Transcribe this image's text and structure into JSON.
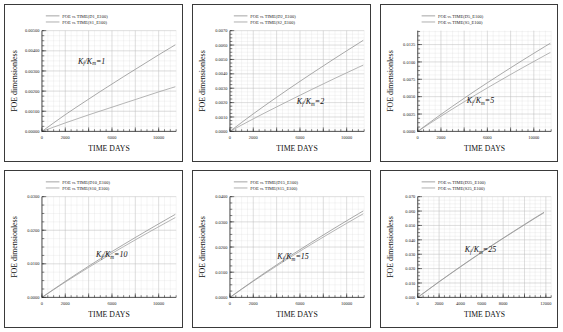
{
  "figure": {
    "panel_count": 6,
    "axis_titles": {
      "x": "TIME DAYS",
      "y": "FOE dimensionless"
    },
    "legend_prefix": "FOE",
    "legend_vs": "vs.",
    "colors": {
      "curve_d": "#8a8a8a",
      "curve_s": "#9a9a9a",
      "grid": "#d6d6d6",
      "axis": "#2b2b2b",
      "border": "#3a3a3a"
    }
  },
  "chart_data": [
    {
      "type": "line",
      "id": "panel-1",
      "title": "",
      "xlabel": "TIME DAYS",
      "ylabel": "FOE dimensionless",
      "annotation": "K_f/K_m=1",
      "annotation_main": "K",
      "annotation_sub1": "f",
      "annotation_mid": "/K",
      "annotation_sub2": "m",
      "annotation_end": "=1",
      "xlim": [
        0,
        11500
      ],
      "ylim": [
        0,
        0.005
      ],
      "xticks": [
        0,
        2000,
        4000,
        6000,
        8000,
        10000
      ],
      "xticklabels": [
        "0",
        "2000",
        "",
        "6000",
        "",
        "10000"
      ],
      "yticks": [
        0,
        0.001,
        0.002,
        0.003,
        0.004,
        0.005
      ],
      "yticklabels": [
        "0.00000",
        "0.00100",
        "0.00200",
        "0.00300",
        "0.00400",
        "0.00500"
      ],
      "grid": true,
      "legend_position": "top-left",
      "series": [
        {
          "name": "FOE vs. TIME(D1_E100)",
          "x": [
            0,
            1000,
            2000,
            3000,
            4000,
            5000,
            6000,
            7000,
            8000,
            9000,
            10000,
            11000,
            11400
          ],
          "values": [
            0.0,
            0.00042,
            0.00083,
            0.00122,
            0.0016,
            0.00198,
            0.00235,
            0.00272,
            0.00308,
            0.00344,
            0.0038,
            0.00415,
            0.00429
          ]
        },
        {
          "name": "FOE vs. TIME(S1_E100)",
          "x": [
            0,
            1000,
            2000,
            3000,
            4000,
            5000,
            6000,
            7000,
            8000,
            9000,
            10000,
            11000,
            11400
          ],
          "values": [
            0.0,
            0.00021,
            0.00042,
            0.00062,
            0.00082,
            0.00101,
            0.0012,
            0.00139,
            0.00158,
            0.00177,
            0.00196,
            0.00214,
            0.00221
          ]
        }
      ]
    },
    {
      "type": "line",
      "id": "panel-2",
      "title": "",
      "xlabel": "TIME DAYS",
      "ylabel": "FOE dimensionless",
      "annotation": "K_f/K_m=2",
      "annotation_main": "K",
      "annotation_sub1": "f",
      "annotation_mid": "/K",
      "annotation_sub2": "m",
      "annotation_end": "=2",
      "xlim": [
        0,
        11500
      ],
      "ylim": [
        0,
        0.007
      ],
      "xticks": [
        0,
        2000,
        4000,
        6000,
        8000,
        10000
      ],
      "xticklabels": [
        "0",
        "2000",
        "",
        "6000",
        "",
        "10000"
      ],
      "yticks": [
        0,
        0.001,
        0.002,
        0.003,
        0.004,
        0.005,
        0.006,
        0.007
      ],
      "yticklabels": [
        "0.0000",
        "0.0010",
        "0.0020",
        "0.0030",
        "0.0040",
        "0.0050",
        "0.0060",
        "0.0070"
      ],
      "grid": true,
      "legend_position": "top-left",
      "series": [
        {
          "name": "FOE vs. TIME(D2_E100)",
          "x": [
            0,
            1000,
            2000,
            3000,
            4000,
            5000,
            6000,
            7000,
            8000,
            9000,
            10000,
            11000,
            11400
          ],
          "values": [
            0.0,
            0.00062,
            0.00122,
            0.0018,
            0.00237,
            0.00293,
            0.00348,
            0.00402,
            0.00455,
            0.00508,
            0.0056,
            0.00611,
            0.00632
          ]
        },
        {
          "name": "FOE vs. TIME(S2_E100)",
          "x": [
            0,
            1000,
            2000,
            3000,
            4000,
            5000,
            6000,
            7000,
            8000,
            9000,
            10000,
            11000,
            11400
          ],
          "values": [
            0.0,
            0.00044,
            0.00087,
            0.00129,
            0.0017,
            0.00211,
            0.00251,
            0.00291,
            0.0033,
            0.00369,
            0.00407,
            0.00445,
            0.0046
          ]
        }
      ]
    },
    {
      "type": "line",
      "id": "panel-3",
      "title": "",
      "xlabel": "TIME DAYS",
      "ylabel": "FOE dimensionless",
      "annotation": "K_f/K_m=5",
      "annotation_main": "K",
      "annotation_sub1": "f",
      "annotation_mid": "/K",
      "annotation_sub2": "m",
      "annotation_end": "=5",
      "xlim": [
        0,
        11500
      ],
      "ylim": [
        0,
        0.0145
      ],
      "xticks": [
        0,
        2000,
        4000,
        6000,
        8000,
        10000
      ],
      "xticklabels": [
        "0",
        "2000",
        "",
        "6000",
        "",
        "10000"
      ],
      "yticks": [
        0,
        0.0025,
        0.005,
        0.0075,
        0.01,
        0.0125
      ],
      "yticklabels": [
        "0.0000",
        "0.0025",
        "0.0050",
        "0.0075",
        "0.0100",
        "0.0125"
      ],
      "grid": true,
      "legend_position": "top-left",
      "series": [
        {
          "name": "FOE vs. TIME(D5_E100)",
          "x": [
            0,
            1000,
            2000,
            3000,
            4000,
            5000,
            6000,
            7000,
            8000,
            9000,
            10000,
            11000,
            11400
          ],
          "values": [
            0.0,
            0.00124,
            0.00245,
            0.00362,
            0.00477,
            0.0059,
            0.007,
            0.00808,
            0.00915,
            0.0102,
            0.01124,
            0.01226,
            0.01266
          ]
        },
        {
          "name": "FOE vs. TIME(S5_E100)",
          "x": [
            0,
            1000,
            2000,
            3000,
            4000,
            5000,
            6000,
            7000,
            8000,
            9000,
            10000,
            11000,
            11400
          ],
          "values": [
            0.0,
            0.0011,
            0.00218,
            0.00323,
            0.00426,
            0.00527,
            0.00626,
            0.00723,
            0.00819,
            0.00913,
            0.01006,
            0.01098,
            0.01134
          ]
        }
      ]
    },
    {
      "type": "line",
      "id": "panel-4",
      "title": "",
      "xlabel": "TIME DAYS",
      "ylabel": "FOE dimensionless",
      "annotation": "K_f/K_m=10",
      "annotation_main": "K",
      "annotation_sub1": "f",
      "annotation_mid": "/K",
      "annotation_sub2": "m",
      "annotation_end": "=10",
      "xlim": [
        0,
        11500
      ],
      "ylim": [
        0,
        0.03
      ],
      "xticks": [
        0,
        2000,
        4000,
        6000,
        8000,
        10000
      ],
      "xticklabels": [
        "0",
        "2000",
        "",
        "6000",
        "",
        "10000"
      ],
      "yticks": [
        0,
        0.01,
        0.02,
        0.03
      ],
      "yticklabels": [
        "0.0000",
        "0.0100",
        "0.0200",
        "0.0300"
      ],
      "grid": true,
      "legend_position": "top-left",
      "series": [
        {
          "name": "FOE vs. TIME(D10_E100)",
          "x": [
            0,
            1000,
            2000,
            3000,
            4000,
            5000,
            6000,
            7000,
            8000,
            9000,
            10000,
            11000,
            11400
          ],
          "values": [
            0.0,
            0.0024,
            0.00476,
            0.00705,
            0.0093,
            0.0115,
            0.01365,
            0.01576,
            0.01783,
            0.01988,
            0.0219,
            0.02389,
            0.02468
          ]
        },
        {
          "name": "FOE vs. TIME(S10_E100)",
          "x": [
            0,
            1000,
            2000,
            3000,
            4000,
            5000,
            6000,
            7000,
            8000,
            9000,
            10000,
            11000,
            11400
          ],
          "values": [
            0.0,
            0.0023,
            0.00456,
            0.00676,
            0.00892,
            0.01103,
            0.0131,
            0.01513,
            0.01713,
            0.0191,
            0.02104,
            0.02296,
            0.02372
          ]
        }
      ]
    },
    {
      "type": "line",
      "id": "panel-5",
      "title": "",
      "xlabel": "TIME DAYS",
      "ylabel": "FOE dimensionless",
      "annotation": "K_f/K_m=15",
      "annotation_main": "K",
      "annotation_sub1": "f",
      "annotation_mid": "/K",
      "annotation_sub2": "m",
      "annotation_end": "=15",
      "xlim": [
        0,
        11500
      ],
      "ylim": [
        0,
        0.04
      ],
      "xticks": [
        0,
        2000,
        4000,
        6000,
        8000,
        10000
      ],
      "xticklabels": [
        "0",
        "2000",
        "",
        "6000",
        "",
        "10000"
      ],
      "yticks": [
        0,
        0.01,
        0.02,
        0.03,
        0.04
      ],
      "yticklabels": [
        "0.0000",
        "0.0100",
        "0.0200",
        "0.0300",
        "0.0400"
      ],
      "grid": true,
      "legend_position": "top-left",
      "series": [
        {
          "name": "FOE vs. TIME(D15_E100)",
          "x": [
            0,
            1000,
            2000,
            3000,
            4000,
            5000,
            6000,
            7000,
            8000,
            9000,
            10000,
            11000,
            11400
          ],
          "values": [
            0.0,
            0.00333,
            0.00661,
            0.00979,
            0.01291,
            0.01597,
            0.01896,
            0.02189,
            0.02477,
            0.02761,
            0.03042,
            0.03318,
            0.03427
          ]
        },
        {
          "name": "FOE vs. TIME(S15_E100)",
          "x": [
            0,
            1000,
            2000,
            3000,
            4000,
            5000,
            6000,
            7000,
            8000,
            9000,
            10000,
            11000,
            11400
          ],
          "values": [
            0.0,
            0.00322,
            0.00639,
            0.00946,
            0.01248,
            0.01544,
            0.01833,
            0.02117,
            0.02395,
            0.0267,
            0.02941,
            0.03209,
            0.03314
          ]
        }
      ]
    },
    {
      "type": "line",
      "id": "panel-6",
      "title": "",
      "xlabel": "TIME DAYS",
      "ylabel": "FOE dimensionless",
      "annotation": "K_f/K_m=25",
      "annotation_main": "K",
      "annotation_sub1": "f",
      "annotation_mid": "/K",
      "annotation_sub2": "m",
      "annotation_end": "=25",
      "xlim": [
        0,
        12500
      ],
      "ylim": [
        0,
        0.07
      ],
      "xticks": [
        0,
        2000,
        4000,
        6000,
        8000,
        10000,
        12000
      ],
      "xticklabels": [
        "0",
        "2000",
        "4000",
        "6000",
        "8000",
        "",
        "12000"
      ],
      "yticks": [
        0,
        0.01,
        0.02,
        0.03,
        0.04,
        0.05,
        0.06,
        0.07
      ],
      "yticklabels": [
        "0.000",
        "0.010",
        "0.020",
        "0.030",
        "0.040",
        "0.050",
        "0.060",
        "0.070"
      ],
      "grid": true,
      "legend_position": "top-left",
      "series": [
        {
          "name": "FOE vs. TIME(D25_E100)",
          "x": [
            0,
            1000,
            2000,
            3000,
            4000,
            5000,
            6000,
            7000,
            8000,
            9000,
            10000,
            11000,
            11800
          ],
          "values": [
            0.0,
            0.0055,
            0.0109,
            0.0162,
            0.0214,
            0.0265,
            0.0315,
            0.0364,
            0.0412,
            0.046,
            0.0507,
            0.0554,
            0.059
          ]
        },
        {
          "name": "FOE vs. TIME(S25_E100)",
          "x": [
            0,
            1000,
            2000,
            3000,
            4000,
            5000,
            6000,
            7000,
            8000,
            9000,
            10000,
            11000,
            11800
          ],
          "values": [
            0.0,
            0.0054,
            0.0108,
            0.016,
            0.0212,
            0.0263,
            0.0313,
            0.0362,
            0.041,
            0.0457,
            0.0504,
            0.0551,
            0.0587
          ]
        }
      ]
    }
  ]
}
